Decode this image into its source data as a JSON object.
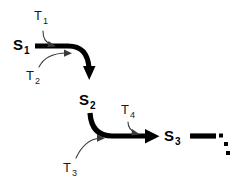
{
  "diagram": {
    "type": "state-transition-chain",
    "background_color": "#ffffff",
    "stroke_color": "#000000",
    "thin_stroke_color": "#3a3a3a",
    "states": [
      {
        "id": "S1",
        "base": "S",
        "subscript": "1",
        "x": 38,
        "y": 50
      },
      {
        "id": "S2",
        "base": "S",
        "subscript": "2",
        "x": 83,
        "y": 105
      },
      {
        "id": "S3",
        "base": "S",
        "subscript": "3",
        "x": 163,
        "y": 141
      }
    ],
    "transitions": [
      {
        "id": "T1",
        "base": "T",
        "subscript": "1",
        "x": 36,
        "y": 20,
        "targets": "S1-to-S2-edge"
      },
      {
        "id": "T2",
        "base": "T",
        "subscript": "2",
        "x": 29,
        "y": 77,
        "targets": "S1-to-S2-edge"
      },
      {
        "id": "T3",
        "base": "T",
        "subscript": "3",
        "x": 66,
        "y": 170,
        "targets": "S2-to-S3-edge"
      },
      {
        "id": "T4",
        "base": "T",
        "subscript": "4",
        "x": 122,
        "y": 115,
        "targets": "S2-to-S3-edge"
      }
    ],
    "edges": [
      {
        "id": "edge-s1-s2",
        "from": "S1",
        "to": "S2",
        "shape": "elbow-right-then-down",
        "arrowhead": "down"
      },
      {
        "id": "edge-s2-s3",
        "from": "S2",
        "to": "S3",
        "shape": "elbow-down-then-right",
        "arrowhead": "right"
      },
      {
        "id": "edge-s3-next",
        "from": "S3",
        "to": "continuation",
        "shape": "straight-right",
        "arrowhead": "none"
      }
    ],
    "continuation": {
      "id": "ellipsis",
      "style": "diagonal-dots",
      "count": 3
    }
  }
}
